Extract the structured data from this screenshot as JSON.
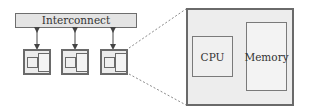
{
  "diagram": {
    "interconnect_label": "Interconnect",
    "nodes": [
      {
        "id": "node-1",
        "x": 23
      },
      {
        "id": "node-2",
        "x": 61
      },
      {
        "id": "node-3",
        "x": 100
      }
    ],
    "zoomed_node": {
      "cpu_label": "CPU",
      "memory_label": "Memory"
    },
    "colors": {
      "stroke": "#6a6a6a",
      "fill": "#ececec",
      "dashed": "#8a8a8a"
    }
  }
}
